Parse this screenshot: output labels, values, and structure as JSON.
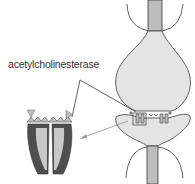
{
  "diagram": {
    "label": "acetylcholinesterase",
    "colors": {
      "outline": "#3a3a3a",
      "neuron_fill": "#e4e4e4",
      "axon_fill": "#bdbdbd",
      "enzyme_dark": "#4e4e4e",
      "enzyme_light": "#c8c8c8",
      "arrow": "#9a9a9a",
      "text": "#333333"
    },
    "parts": [
      "upper-axon",
      "presynaptic-terminal",
      "synaptic-cleft-receptors",
      "postsynaptic-membrane",
      "lower-axon",
      "acetylcholinesterase-enzyme",
      "callout-lines"
    ]
  }
}
